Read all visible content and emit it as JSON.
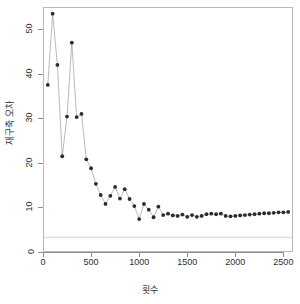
{
  "chart_data": {
    "type": "line",
    "title": "",
    "subtitle": "",
    "xlabel": "횟수",
    "ylabel": "재구축 오차",
    "xlim": [
      0,
      2600
    ],
    "ylim": [
      0,
      55
    ],
    "grid": false,
    "legend": null,
    "marker": "filled-circle",
    "line_color": "#a8a8a8",
    "marker_color": "#2b2b2b",
    "xticks": [
      0,
      500,
      1000,
      1500,
      2000,
      2500
    ],
    "yticks": [
      0,
      10,
      20,
      30,
      40,
      50
    ],
    "xtick_labels": [
      "0",
      "500",
      "1000",
      "1500",
      "2000",
      "2500"
    ],
    "ytick_labels": [
      "0",
      "10",
      "20",
      "30",
      "40",
      "50"
    ],
    "reference_line": {
      "orientation": "horizontal",
      "y": 3.3,
      "color": "#cfcfcf"
    },
    "x": [
      50,
      100,
      150,
      200,
      250,
      300,
      350,
      400,
      450,
      500,
      550,
      600,
      650,
      700,
      750,
      800,
      850,
      900,
      950,
      1000,
      1050,
      1100,
      1150,
      1200,
      1250,
      1300,
      1350,
      1400,
      1450,
      1500,
      1550,
      1600,
      1650,
      1700,
      1750,
      1800,
      1850,
      1900,
      1950,
      2000,
      2050,
      2100,
      2150,
      2200,
      2250,
      2300,
      2350,
      2400,
      2450,
      2500,
      2550
    ],
    "values": [
      37.5,
      53.5,
      42.0,
      21.5,
      30.4,
      47.0,
      30.3,
      31.0,
      20.8,
      18.8,
      15.3,
      12.8,
      10.8,
      12.6,
      14.6,
      12.0,
      14.1,
      11.9,
      10.3,
      7.4,
      10.8,
      9.5,
      7.8,
      10.2,
      8.3,
      8.6,
      8.2,
      8.1,
      8.4,
      7.9,
      8.3,
      7.9,
      8.1,
      8.5,
      8.6,
      8.5,
      8.6,
      8.1,
      8.0,
      8.1,
      8.2,
      8.3,
      8.4,
      8.5,
      8.6,
      8.7,
      8.7,
      8.8,
      8.9,
      8.9,
      9.0
    ]
  },
  "axes": {
    "y_title": "재구축 오차",
    "x_title": "횟수"
  }
}
